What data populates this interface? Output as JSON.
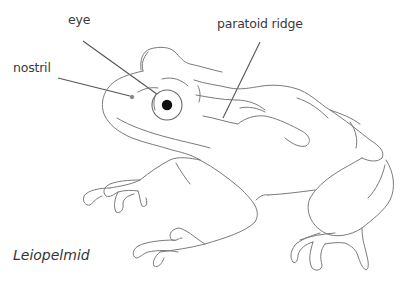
{
  "diagram": {
    "caption": "Leiopelmid",
    "labels": {
      "eye": "eye",
      "nostril": "nostril",
      "paratoid_ridge": "paratoid ridge"
    }
  }
}
